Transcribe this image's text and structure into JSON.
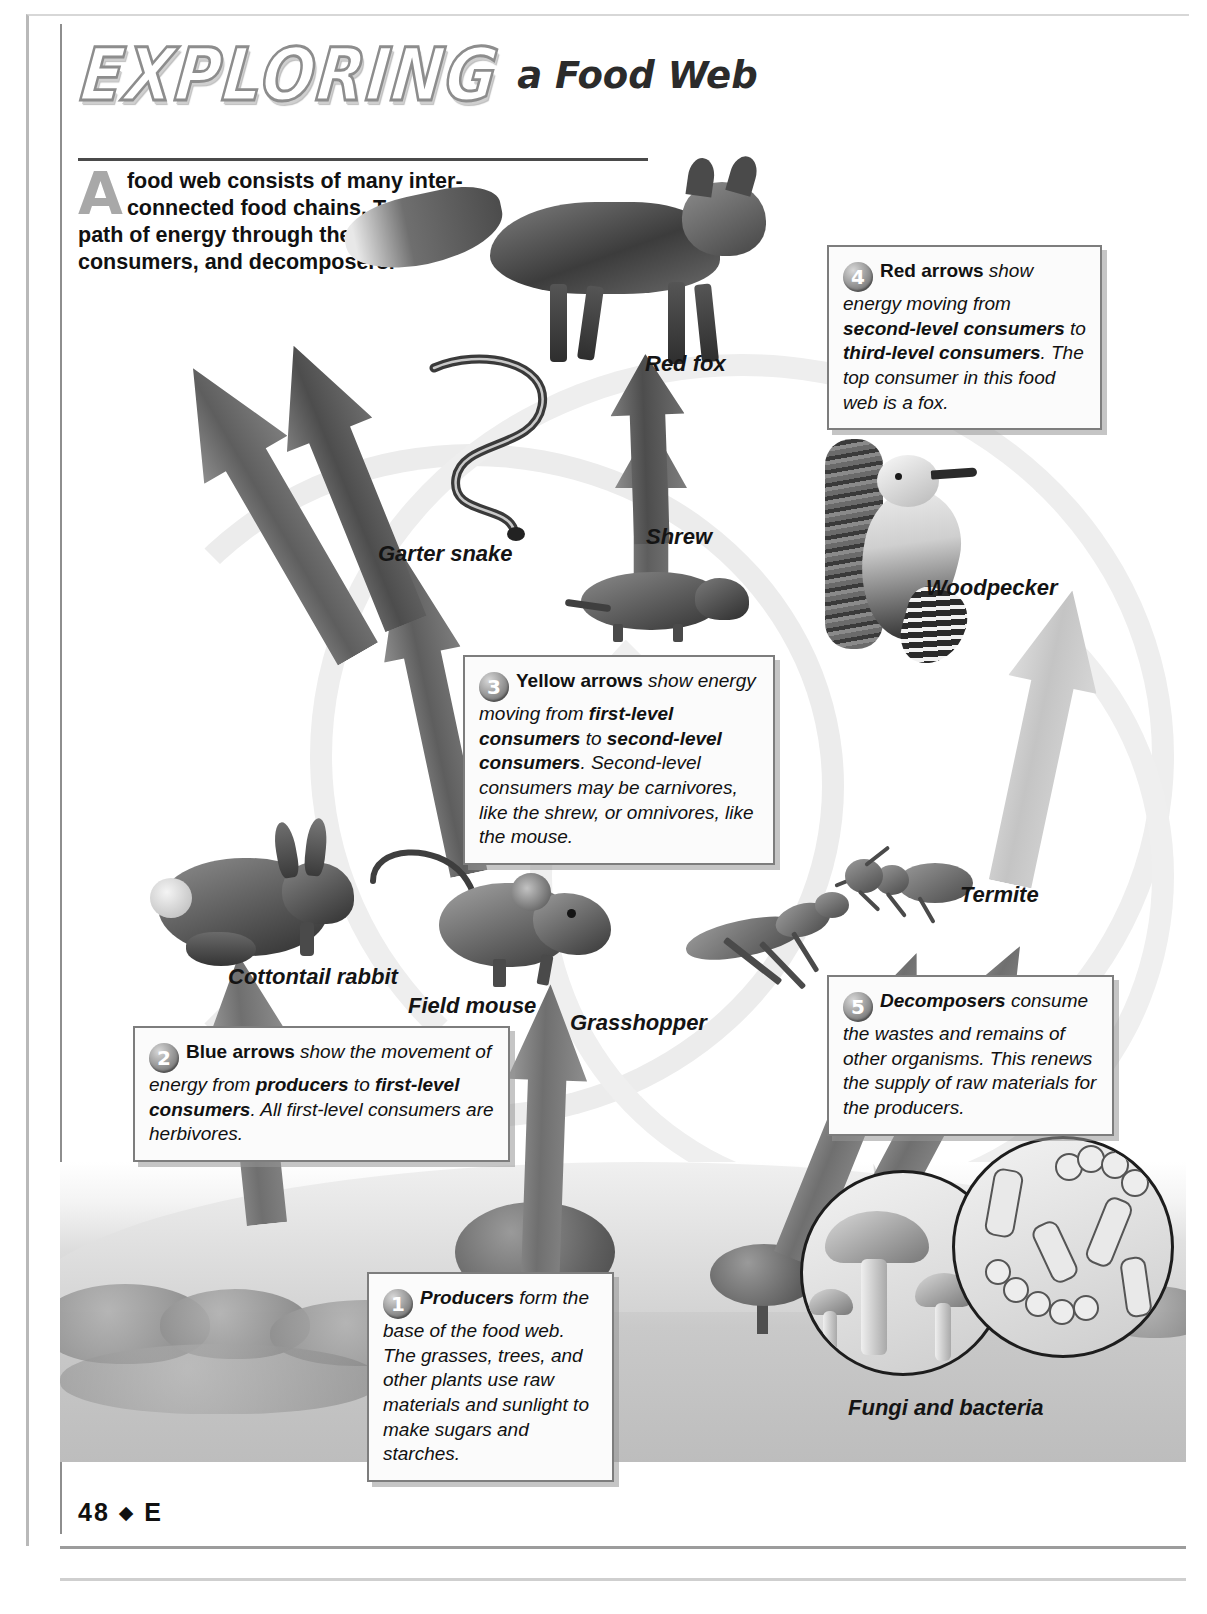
{
  "page": {
    "folio_number": "48",
    "folio_separator": "◆",
    "folio_letter": "E"
  },
  "header": {
    "word_exploring": "EXPLORING",
    "subtitle": "a Food Web"
  },
  "intro": {
    "dropcap": "A",
    "text": " food web consists of many inter­connected food chains. Trace the path of energy through the producers, consumers, and decomposers."
  },
  "labels": [
    {
      "id": "red-fox",
      "text": "Red fox"
    },
    {
      "id": "garter-snake",
      "text": "Garter snake"
    },
    {
      "id": "shrew",
      "text": "Shrew"
    },
    {
      "id": "woodpecker",
      "text": "Woodpecker"
    },
    {
      "id": "termite",
      "text": "Termite"
    },
    {
      "id": "cottontail-rabbit",
      "text": "Cottontail rabbit"
    },
    {
      "id": "field-mouse",
      "text": "Field mouse"
    },
    {
      "id": "grasshopper",
      "text": "Grasshopper"
    },
    {
      "id": "fungi-and-bacteria",
      "text": "Fungi and bacteria"
    }
  ],
  "callouts": [
    {
      "id": "producers",
      "number": "1",
      "lead": "Producers",
      "body": " form the base of the food web. The grasses, trees, and other plants use raw materials and sunlight to make sugars and starches."
    },
    {
      "id": "blue-arrows",
      "number": "2",
      "lead": "Blue arrows",
      "body_1": " show the movement of energy from ",
      "emph_1": "producers",
      "body_2": " to ",
      "emph_2": "first-level consumers",
      "body_3": ". All first-level consumers are herbivores."
    },
    {
      "id": "yellow-arrows",
      "number": "3",
      "lead": "Yellow arrows",
      "body_1": " show energy moving from ",
      "emph_1": "first-level consumers",
      "body_2": " to ",
      "emph_2": "second-level consumers",
      "body_3": ". Second-level consumers may be carnivores, like the shrew, or omnivores, like the mouse."
    },
    {
      "id": "red-arrows",
      "number": "4",
      "lead": "Red arrows",
      "body_1": " show energy moving from ",
      "emph_1": "second-level consumers",
      "body_2": " to ",
      "emph_2": "third-level consumers",
      "body_3": ". The top consumer in this food web is a fox."
    },
    {
      "id": "decomposers",
      "number": "5",
      "lead": "Decomposers",
      "body": " consume the wastes and remains of other organisms. This renews the supply of raw materials for the producers."
    }
  ],
  "colors": {
    "ink": "#111111",
    "box_border": "#7d7d7d",
    "box_fill": "#fbfbfb",
    "number_bubble": "#8b8b8b",
    "arrow_blue": "#6f6f6f",
    "arrow_yellow": "#5e5e5e",
    "arrow_red": "#4d4d4d"
  }
}
